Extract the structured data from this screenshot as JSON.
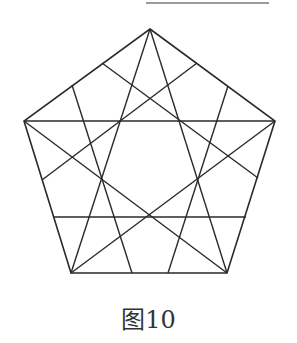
{
  "caption": "图10",
  "colors": {
    "stroke": "#2a2a2a",
    "top_rule": "#7a7a7a",
    "background": "#ffffff"
  },
  "diagram": {
    "top_rule": {
      "x1": 146,
      "y1": 3,
      "x2": 269,
      "y2": 3
    },
    "pentagon": {
      "vertices": [
        {
          "name": "A",
          "x": 150,
          "y": 29
        },
        {
          "name": "B",
          "x": 275,
          "y": 121
        },
        {
          "name": "C",
          "x": 227,
          "y": 273
        },
        {
          "name": "D",
          "x": 71,
          "y": 273
        },
        {
          "name": "E",
          "x": 24,
          "y": 121
        }
      ]
    },
    "lines": [
      {
        "id": "diag-BE",
        "x1": 24,
        "y1": 121,
        "x2": 275,
        "y2": 121
      },
      {
        "id": "diag-AD",
        "x1": 150,
        "y1": 29,
        "x2": 71,
        "y2": 273
      },
      {
        "id": "diag-AC",
        "x1": 150,
        "y1": 29,
        "x2": 227,
        "y2": 273
      },
      {
        "id": "diag-BD",
        "x1": 275,
        "y1": 121,
        "x2": 71,
        "y2": 273
      },
      {
        "id": "diag-EC",
        "x1": 24,
        "y1": 121,
        "x2": 227,
        "y2": 273
      },
      {
        "id": "horizontal-lower",
        "x1": 54,
        "y1": 217,
        "x2": 246,
        "y2": 217
      },
      {
        "id": "AE-to-BC",
        "x1": 102,
        "y1": 63,
        "x2": 258,
        "y2": 178
      },
      {
        "id": "AB-to-ED",
        "x1": 197,
        "y1": 63,
        "x2": 42,
        "y2": 180
      },
      {
        "id": "AE-to-DC",
        "x1": 72,
        "y1": 85,
        "x2": 132,
        "y2": 273
      },
      {
        "id": "AB-to-DC",
        "x1": 228,
        "y1": 86,
        "x2": 168,
        "y2": 273
      }
    ]
  }
}
